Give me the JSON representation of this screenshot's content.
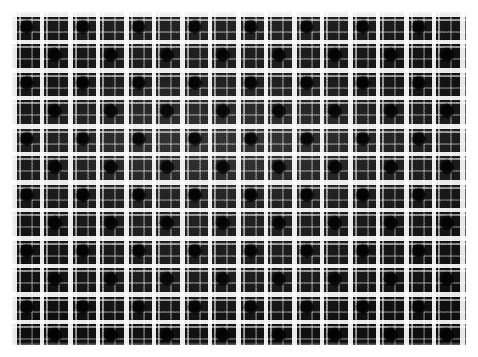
{
  "image": {
    "subject": "plaid-fabric-swatch",
    "description": "Close-up photograph of black and white checked (tartan / plaid) woven fabric",
    "pattern_name": "black-and-white-windowpane-plaid",
    "weave": "houndstooth-grain twill",
    "canvas": {
      "width": 478,
      "height": 357,
      "background_color": "#ffffff"
    },
    "swatch": {
      "left": 12,
      "top": 12,
      "width": 454,
      "height": 333
    }
  },
  "palette": {
    "page_background": "#ffffff",
    "cloth_base": "#0d0d0d",
    "cloth_shadow": "#050505",
    "stripe_bright": "#e8e8e8",
    "stripe_mid": "#9a9a9a",
    "stripe_dim": "#5a5a5a",
    "block_dark": "#060606"
  },
  "pattern": {
    "repeat_px": 56,
    "symmetry": "even-check (warp equals weft)",
    "warp_stripes": [
      {
        "offset": 0,
        "width": 5,
        "tone": "stripe_bright",
        "kind": "wide-light-band"
      },
      {
        "offset": 7,
        "width": 2,
        "tone": "stripe_mid",
        "kind": "companion-line"
      },
      {
        "offset": 19,
        "width": 2,
        "tone": "stripe_dim",
        "kind": "thin-line"
      },
      {
        "offset": 28,
        "width": 4,
        "tone": "stripe_bright",
        "kind": "wide-light-band"
      },
      {
        "offset": 34,
        "width": 2,
        "tone": "stripe_mid",
        "kind": "companion-line"
      },
      {
        "offset": 46,
        "width": 2,
        "tone": "stripe_dim",
        "kind": "thin-line"
      }
    ],
    "weft_stripes": [
      {
        "offset": 0,
        "width": 5,
        "tone": "stripe_bright",
        "kind": "wide-light-band"
      },
      {
        "offset": 7,
        "width": 2,
        "tone": "stripe_mid",
        "kind": "companion-line"
      },
      {
        "offset": 19,
        "width": 2,
        "tone": "stripe_dim",
        "kind": "thin-line"
      },
      {
        "offset": 28,
        "width": 4,
        "tone": "stripe_bright",
        "kind": "wide-light-band"
      },
      {
        "offset": 34,
        "width": 2,
        "tone": "stripe_mid",
        "kind": "companion-line"
      },
      {
        "offset": 46,
        "width": 2,
        "tone": "stripe_dim",
        "kind": "thin-line"
      }
    ],
    "dark_blocks": {
      "description": "Deep near-black squares sit between the two light bands of each repeat",
      "size_px": 10,
      "repeat_px": 56
    },
    "counts": {
      "repeats_horizontal": 8,
      "repeats_vertical": 6
    }
  },
  "texture": {
    "grain_cell_px": 3,
    "thread_pitch_px": 2,
    "noise_opacity": 0.4,
    "lighting": "soft top-down highlight with darker lower-right falloff"
  }
}
